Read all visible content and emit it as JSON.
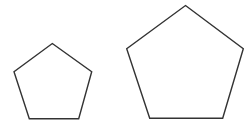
{
  "diagram": {
    "stroke_color": "#333333",
    "fill_color": "#ffffff",
    "shapes": [
      {
        "name": "small-pentagon",
        "type": "pentagon",
        "points": [
          [
            52.3,
            43.5
          ],
          [
            91.7,
            71.7
          ],
          [
            78.7,
            118.7
          ],
          [
            29.3,
            118.7
          ],
          [
            14,
            71.7
          ]
        ]
      },
      {
        "name": "large-pentagon",
        "type": "pentagon",
        "points": [
          [
            185.5,
            5.5
          ],
          [
            243.3,
            48.7
          ],
          [
            222.7,
            118.3
          ],
          [
            149.7,
            118.3
          ],
          [
            126.7,
            48.7
          ]
        ]
      }
    ]
  }
}
